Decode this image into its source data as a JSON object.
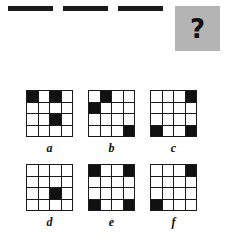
{
  "puzzle": {
    "type": "matrix-reasoning-grid-puzzle",
    "grid_size": 4,
    "colors": {
      "filled_cell": "#111111",
      "empty_cell": "#ffffff",
      "grid_line": "#1a1a1a",
      "question_panel_background": "#b4b4b4",
      "page_background": "#ffffff"
    },
    "sequence": {
      "name": "sequence-row",
      "panels": [
        {
          "name": "sequence-panel-1",
          "position": 1,
          "filled_cells": [
            [
              1,
              1
            ]
          ],
          "rows": [
            [
              1,
              0,
              0,
              0
            ],
            [
              0,
              0,
              0,
              0
            ],
            [
              0,
              0,
              0,
              0
            ],
            [
              0,
              0,
              0,
              0
            ]
          ]
        },
        {
          "name": "sequence-panel-2",
          "position": 2,
          "filled_cells": [
            [
              1,
              2
            ],
            [
              2,
              1
            ],
            [
              2,
              2
            ]
          ],
          "rows": [
            [
              0,
              1,
              0,
              0
            ],
            [
              1,
              1,
              0,
              0
            ],
            [
              0,
              0,
              0,
              0
            ],
            [
              0,
              0,
              0,
              0
            ]
          ]
        },
        {
          "name": "sequence-panel-3",
          "position": 3,
          "filled_cells": [
            [
              1,
              3
            ],
            [
              3,
              1
            ],
            [
              3,
              3
            ]
          ],
          "rows": [
            [
              0,
              0,
              1,
              0
            ],
            [
              0,
              0,
              0,
              0
            ],
            [
              1,
              0,
              1,
              0
            ],
            [
              0,
              0,
              0,
              0
            ]
          ]
        }
      ],
      "question_panel": {
        "name": "question-panel",
        "position": 4,
        "label": "?"
      }
    },
    "options": [
      {
        "name": "option-a",
        "label": "a",
        "filled_cells": [
          [
            1,
            1
          ],
          [
            1,
            3
          ],
          [
            3,
            3
          ]
        ],
        "rows": [
          [
            1,
            0,
            1,
            0
          ],
          [
            0,
            0,
            0,
            0
          ],
          [
            0,
            0,
            1,
            0
          ],
          [
            0,
            0,
            0,
            0
          ]
        ]
      },
      {
        "name": "option-b",
        "label": "b",
        "filled_cells": [
          [
            1,
            2
          ],
          [
            2,
            1
          ],
          [
            4,
            4
          ]
        ],
        "rows": [
          [
            0,
            1,
            0,
            0
          ],
          [
            1,
            0,
            0,
            0
          ],
          [
            0,
            0,
            0,
            0
          ],
          [
            0,
            0,
            0,
            1
          ]
        ]
      },
      {
        "name": "option-c",
        "label": "c",
        "filled_cells": [
          [
            1,
            4
          ],
          [
            4,
            1
          ],
          [
            4,
            4
          ]
        ],
        "rows": [
          [
            0,
            0,
            0,
            1
          ],
          [
            0,
            0,
            0,
            0
          ],
          [
            0,
            0,
            0,
            0
          ],
          [
            1,
            0,
            0,
            1
          ]
        ]
      },
      {
        "name": "option-d",
        "label": "d",
        "filled_cells": [
          [
            3,
            3
          ]
        ],
        "rows": [
          [
            0,
            0,
            0,
            0
          ],
          [
            0,
            0,
            0,
            0
          ],
          [
            0,
            0,
            1,
            0
          ],
          [
            0,
            0,
            0,
            0
          ]
        ]
      },
      {
        "name": "option-e",
        "label": "e",
        "filled_cells": [
          [
            1,
            1
          ],
          [
            1,
            4
          ],
          [
            4,
            1
          ],
          [
            4,
            4
          ]
        ],
        "rows": [
          [
            1,
            0,
            0,
            1
          ],
          [
            0,
            0,
            0,
            0
          ],
          [
            0,
            0,
            0,
            0
          ],
          [
            1,
            0,
            0,
            1
          ]
        ]
      },
      {
        "name": "option-f",
        "label": "f",
        "filled_cells": [
          [
            1,
            4
          ],
          [
            4,
            1
          ]
        ],
        "rows": [
          [
            0,
            0,
            0,
            1
          ],
          [
            0,
            0,
            0,
            0
          ],
          [
            0,
            0,
            0,
            0
          ],
          [
            1,
            0,
            0,
            0
          ]
        ]
      }
    ]
  }
}
